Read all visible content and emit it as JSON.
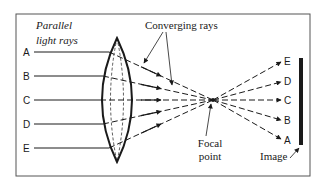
{
  "labels": {
    "parallel_rays": [
      "Parallel",
      "light rays"
    ],
    "converging_rays": "Converging rays",
    "focal_point": [
      "Focal",
      "point"
    ],
    "image": "Image"
  },
  "incoming_rays": [
    {
      "label": "A",
      "y": 52
    },
    {
      "label": "B",
      "y": 76
    },
    {
      "label": "C",
      "y": 100
    },
    {
      "label": "D",
      "y": 124
    },
    {
      "label": "E",
      "y": 148
    }
  ],
  "outgoing_rays": [
    {
      "label": "E",
      "y": 62
    },
    {
      "label": "D",
      "y": 82
    },
    {
      "label": "C",
      "y": 100
    },
    {
      "label": "B",
      "y": 120
    },
    {
      "label": "A",
      "y": 139
    }
  ],
  "colors": {
    "line": "#1a1a1a",
    "frame": "#555555",
    "background": "#ffffff"
  }
}
